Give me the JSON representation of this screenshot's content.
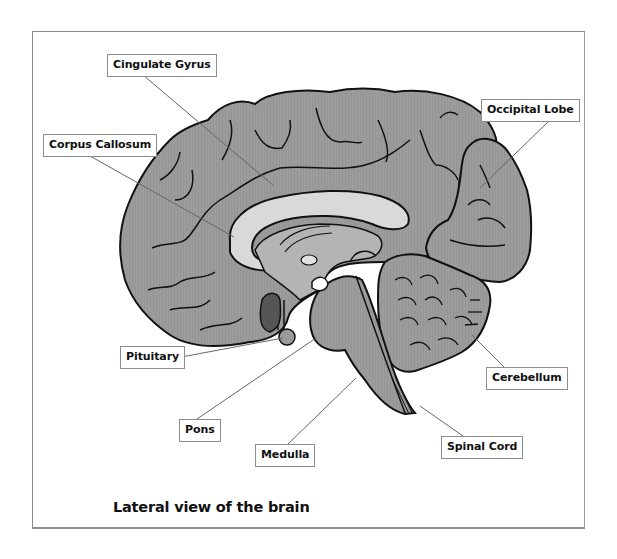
{
  "diagram": {
    "title": "Lateral view of the brain",
    "colors": {
      "cerebrum": "#9a9a9a",
      "corpus_callosum": "#d8d8d8",
      "outline": "#111111",
      "leader_line": "#666666",
      "label_border": "#8c8c8c",
      "frame_border": "#8a8a8a",
      "pituitary_dark": "#555555"
    },
    "labels": [
      {
        "id": "cingulate-gyrus",
        "text": "Cingulate Gyrus"
      },
      {
        "id": "corpus-callosum",
        "text": "Corpus Callosum"
      },
      {
        "id": "occipital-lobe",
        "text": "Occipital Lobe"
      },
      {
        "id": "pituitary",
        "text": "Pituitary"
      },
      {
        "id": "pons",
        "text": "Pons"
      },
      {
        "id": "medulla",
        "text": "Medulla"
      },
      {
        "id": "cerebellum",
        "text": "Cerebellum"
      },
      {
        "id": "spinal-cord",
        "text": "Spinal Cord"
      }
    ]
  }
}
